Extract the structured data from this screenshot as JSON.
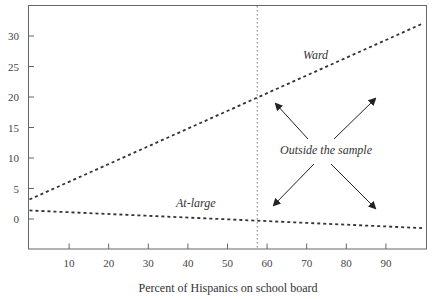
{
  "chart_data": {
    "type": "line",
    "title": "",
    "xlabel": "Percent of Hispanics on school board",
    "ylabel": "",
    "xlim": [
      0,
      100
    ],
    "ylim": [
      -5,
      35
    ],
    "x_ticks": [
      10,
      20,
      30,
      40,
      50,
      60,
      70,
      80,
      90
    ],
    "y_ticks": [
      0,
      5,
      10,
      15,
      20,
      25,
      30
    ],
    "grid": false,
    "legend": "none (inline labels)",
    "series": [
      {
        "name": "Ward",
        "style": "dashed",
        "x": [
          0,
          100
        ],
        "y": [
          3.2,
          32.1
        ]
      },
      {
        "name": "At-large",
        "style": "dashed",
        "x": [
          0,
          100
        ],
        "y": [
          1.4,
          -1.5
        ]
      }
    ],
    "reference_lines": [
      {
        "orientation": "vertical",
        "x": 57.5,
        "style": "dotted"
      }
    ],
    "annotations": [
      {
        "text": "Ward",
        "x": 70,
        "y": 26.5,
        "italic": true
      },
      {
        "text": "At-large",
        "x": 40,
        "y": 2.2,
        "italic": true
      },
      {
        "text": "Outside the sample",
        "x": 80,
        "y": 11,
        "italic": true,
        "arrows": [
          "up-left",
          "up-right",
          "down-left",
          "down-right"
        ]
      }
    ]
  },
  "labels": {
    "x_axis_title": "Percent of Hispanics on school board",
    "ward": "Ward",
    "at_large": "At-large",
    "outside": "Outside the sample",
    "x_ticks": [
      "10",
      "20",
      "30",
      "40",
      "50",
      "60",
      "70",
      "80",
      "90"
    ],
    "y_ticks": [
      "0",
      "5",
      "10",
      "15",
      "20",
      "25",
      "30"
    ]
  }
}
